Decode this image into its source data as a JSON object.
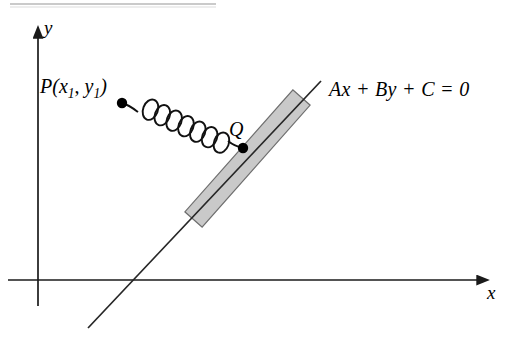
{
  "figure": {
    "type": "geometry-diagram",
    "background_color": "#ffffff",
    "stroke_color": "#1a1a1a",
    "plank_fill_color": "#c9c9c9",
    "plank_edge_color": "#5a5a5a",
    "width": 510,
    "height": 342
  },
  "axes": {
    "x_label": "x",
    "y_label": "y",
    "origin": {
      "x": 38,
      "y": 280
    },
    "x_axis": {
      "x1": 8,
      "y1": 280,
      "x2": 486,
      "y2": 280,
      "arrow": "right"
    },
    "y_axis": {
      "x1": 38,
      "y1": 306,
      "x2": 38,
      "y2": 29,
      "arrow": "up"
    }
  },
  "line": {
    "equation": "Ax + By + C = 0",
    "equation_parts": {
      "a_term": "Ax",
      "plus_1": "+",
      "b_term": "By",
      "plus_2": "+",
      "c_term": "C",
      "equals": "=",
      "rhs": "0"
    },
    "start": {
      "x": 88,
      "y": 328
    },
    "end": {
      "x": 321,
      "y": 81
    }
  },
  "points": [
    {
      "name": "P",
      "label": "P(x1, y1)",
      "label_base": "P(",
      "label_x": "x",
      "label_x_sub": "1",
      "label_comma": ", ",
      "label_y": "y",
      "label_y_sub": "1",
      "label_close": ")",
      "x": 122,
      "y": 103,
      "radius": 5
    },
    {
      "name": "Q",
      "label": "Q",
      "x": 243,
      "y": 148,
      "radius": 5
    }
  ],
  "spring": {
    "from_point": "P",
    "to_point": "Q",
    "coils": 7,
    "description": "coiled spring connecting P to Q"
  },
  "plank": {
    "description": "shaded rectangular bar lying along the line through Q",
    "corner_top_right": {
      "x": 296,
      "y": 104
    },
    "corner_bottom_left": {
      "x": 199,
      "y": 213
    },
    "thickness": 22
  },
  "scan_artifact": {
    "visible": true,
    "description": "faint horizontal scan line at top of page",
    "x1": 10,
    "x2": 216,
    "y": 4
  }
}
